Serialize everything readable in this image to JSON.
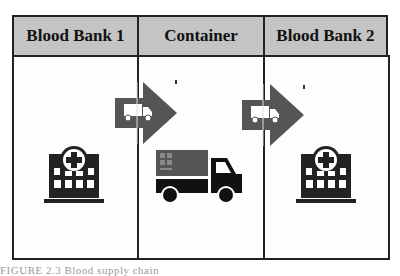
{
  "columns": [
    {
      "label": "Blood Bank 1",
      "icon": "hospital-icon"
    },
    {
      "label": "Container",
      "icon": "delivery-truck-icon"
    },
    {
      "label": "Blood Bank 2",
      "icon": "hospital-icon"
    }
  ],
  "arrows": [
    {
      "from": "Blood Bank 1",
      "to": "Container",
      "icon": "truck-arrow-icon"
    },
    {
      "from": "Container",
      "to": "Blood Bank 2",
      "icon": "truck-arrow-icon"
    }
  ],
  "colors": {
    "header_bg": "#c4c4c4",
    "border": "#222222",
    "arrow": "#555555",
    "icon": "#222222",
    "truck_cargo": "#555555"
  },
  "caption": "FIGURE 2.3 Blood supply chain"
}
